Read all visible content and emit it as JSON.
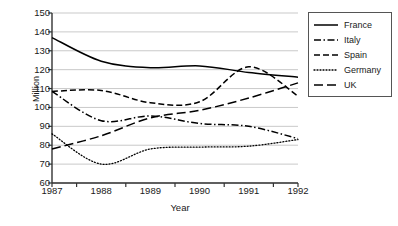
{
  "chart_data": {
    "type": "line",
    "title": "",
    "xlabel": "Year",
    "ylabel": "Million",
    "x": [
      1987,
      1988,
      1989,
      1990,
      1991,
      1992
    ],
    "xtick_labels": [
      "1987",
      "1988",
      "1989",
      "1990",
      "1991",
      "1992"
    ],
    "ytick_labels": [
      "60",
      "70",
      "80",
      "90",
      "100",
      "110",
      "120",
      "130",
      "140",
      "150"
    ],
    "ytick_values": [
      60,
      70,
      80,
      90,
      100,
      110,
      120,
      130,
      140,
      150
    ],
    "ylim": [
      60,
      150
    ],
    "xlim": [
      1987,
      1992
    ],
    "grid": "horizontal",
    "legend_position": "right",
    "series": [
      {
        "name": "France",
        "style": "solid",
        "color": "#000000",
        "values": [
          137,
          124.5,
          121,
          122,
          118.5,
          116
        ]
      },
      {
        "name": "Italy",
        "style": "dash-dot",
        "color": "#000000",
        "values": [
          108.5,
          93,
          95.5,
          91.5,
          90,
          83.5
        ]
      },
      {
        "name": "Spain",
        "style": "dashed",
        "color": "#000000",
        "values": [
          108.5,
          109,
          102.5,
          103,
          121.5,
          106
        ]
      },
      {
        "name": "Germany",
        "style": "dotted",
        "color": "#000000",
        "values": [
          86,
          70,
          78,
          79,
          79.5,
          83
        ]
      },
      {
        "name": "UK",
        "style": "long-dash",
        "color": "#000000",
        "values": [
          78,
          85,
          94.5,
          98.5,
          105,
          113
        ]
      }
    ],
    "legend_entries": [
      "France",
      "Italy",
      "Spain",
      "Germany",
      "UK"
    ]
  },
  "colors": {
    "axis": "#333333",
    "grid": "#bbbbbb",
    "line": "#000000",
    "legend_border": "#555555",
    "background": "#ffffff"
  }
}
